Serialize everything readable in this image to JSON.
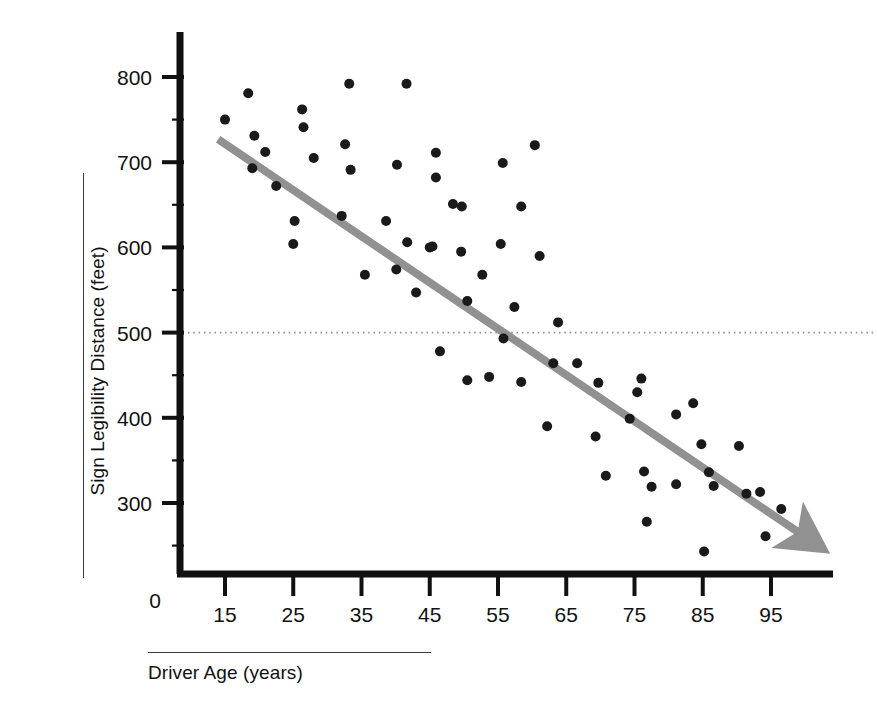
{
  "chart_data": {
    "type": "scatter",
    "title": "",
    "xlabel": "Driver Age (years)",
    "ylabel": "Sign Legibility Distance (feet)",
    "xlim": [
      10,
      101
    ],
    "ylim": [
      0,
      840
    ],
    "xticks": [
      15,
      25,
      35,
      45,
      55,
      65,
      75,
      85,
      95
    ],
    "xtick_labels": [
      "15",
      "25",
      "35",
      "45",
      "55",
      "65",
      "75",
      "85",
      "95"
    ],
    "yticks": [
      300,
      400,
      500,
      600,
      700,
      800
    ],
    "ytick_labels": [
      "300",
      "400",
      "500",
      "600",
      "700",
      "800"
    ],
    "origin_label": "0",
    "grid": false,
    "legend": null,
    "point_color": "#1a1a1a",
    "point_radius": 5,
    "trendline": {
      "name": "fitted regression line with arrowhead",
      "color": "#919191",
      "width": 8,
      "x_start": 14.0,
      "y_start": 727,
      "x_end": 99.5,
      "y_end": 263,
      "arrow": true
    },
    "reference_line": {
      "name": "dotted reference at 500 feet",
      "value": 500,
      "style": "dotted",
      "color": "#8d8d8d",
      "orientation": "horizontal"
    },
    "points": [
      {
        "x": 15.0,
        "y": 750
      },
      {
        "x": 18.4,
        "y": 781
      },
      {
        "x": 19.3,
        "y": 731
      },
      {
        "x": 20.9,
        "y": 712
      },
      {
        "x": 19.0,
        "y": 693
      },
      {
        "x": 22.5,
        "y": 672
      },
      {
        "x": 25.2,
        "y": 631
      },
      {
        "x": 25.0,
        "y": 604
      },
      {
        "x": 26.3,
        "y": 762
      },
      {
        "x": 26.5,
        "y": 741
      },
      {
        "x": 28.0,
        "y": 705
      },
      {
        "x": 32.1,
        "y": 637
      },
      {
        "x": 32.6,
        "y": 721
      },
      {
        "x": 33.2,
        "y": 792
      },
      {
        "x": 33.4,
        "y": 691
      },
      {
        "x": 35.5,
        "y": 568
      },
      {
        "x": 38.6,
        "y": 631
      },
      {
        "x": 40.1,
        "y": 574
      },
      {
        "x": 40.2,
        "y": 697
      },
      {
        "x": 41.6,
        "y": 792
      },
      {
        "x": 41.7,
        "y": 606
      },
      {
        "x": 43.0,
        "y": 547
      },
      {
        "x": 45.0,
        "y": 600
      },
      {
        "x": 45.4,
        "y": 601
      },
      {
        "x": 45.9,
        "y": 711
      },
      {
        "x": 45.9,
        "y": 682
      },
      {
        "x": 46.5,
        "y": 478
      },
      {
        "x": 48.4,
        "y": 651
      },
      {
        "x": 49.6,
        "y": 595
      },
      {
        "x": 49.7,
        "y": 648
      },
      {
        "x": 50.5,
        "y": 444
      },
      {
        "x": 50.5,
        "y": 537
      },
      {
        "x": 52.7,
        "y": 568
      },
      {
        "x": 53.7,
        "y": 448
      },
      {
        "x": 55.4,
        "y": 604
      },
      {
        "x": 55.7,
        "y": 699
      },
      {
        "x": 55.8,
        "y": 493
      },
      {
        "x": 57.4,
        "y": 530
      },
      {
        "x": 58.4,
        "y": 648
      },
      {
        "x": 58.4,
        "y": 442
      },
      {
        "x": 60.4,
        "y": 720
      },
      {
        "x": 61.1,
        "y": 590
      },
      {
        "x": 62.2,
        "y": 390
      },
      {
        "x": 63.1,
        "y": 464
      },
      {
        "x": 63.8,
        "y": 512
      },
      {
        "x": 66.6,
        "y": 464
      },
      {
        "x": 69.3,
        "y": 378
      },
      {
        "x": 69.7,
        "y": 441
      },
      {
        "x": 70.8,
        "y": 332
      },
      {
        "x": 74.3,
        "y": 399
      },
      {
        "x": 75.4,
        "y": 430
      },
      {
        "x": 76.0,
        "y": 446
      },
      {
        "x": 76.4,
        "y": 337
      },
      {
        "x": 76.8,
        "y": 278
      },
      {
        "x": 77.5,
        "y": 319
      },
      {
        "x": 81.1,
        "y": 404
      },
      {
        "x": 81.1,
        "y": 322
      },
      {
        "x": 83.6,
        "y": 417
      },
      {
        "x": 84.8,
        "y": 369
      },
      {
        "x": 85.2,
        "y": 243
      },
      {
        "x": 85.9,
        "y": 336
      },
      {
        "x": 86.6,
        "y": 320
      },
      {
        "x": 90.3,
        "y": 367
      },
      {
        "x": 91.4,
        "y": 311
      },
      {
        "x": 93.4,
        "y": 313
      },
      {
        "x": 96.5,
        "y": 293
      },
      {
        "x": 94.2,
        "y": 261
      }
    ]
  }
}
